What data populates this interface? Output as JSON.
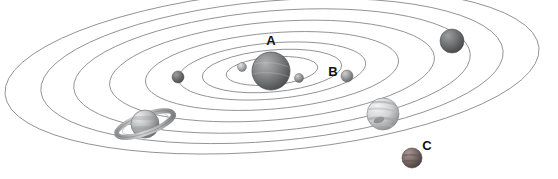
{
  "diagram": {
    "background_color": "#ffffff",
    "orbit_line_color": "#808080",
    "label_color": "#111111",
    "labels": [
      {
        "id": "A",
        "text": "A",
        "x": 271,
        "y": 45,
        "refers_to": "central star (sun)"
      },
      {
        "id": "B",
        "text": "B",
        "x": 333,
        "y": 76,
        "refers_to": "inner planet on orbit 3"
      },
      {
        "id": "C",
        "text": "C",
        "x": 427,
        "y": 150,
        "refers_to": "outer small planet on orbit 7"
      }
    ],
    "orbits": [
      {
        "index": 1,
        "rx": 46,
        "ry": 14,
        "note": "innermost orbit"
      },
      {
        "index": 2,
        "rx": 70,
        "ry": 21,
        "note": "second orbit"
      },
      {
        "index": 3,
        "rx": 94,
        "ry": 28,
        "note": "third orbit, planet B"
      },
      {
        "index": 4,
        "rx": 127,
        "ry": 38,
        "note": "fourth orbit"
      },
      {
        "index": 5,
        "rx": 163,
        "ry": 49,
        "note": "fifth orbit, ringed planet"
      },
      {
        "index": 6,
        "rx": 199,
        "ry": 60,
        "note": "sixth orbit, striped gas giant"
      },
      {
        "index": 7,
        "rx": 232,
        "ry": 70,
        "note": "seventh orbit, planet C"
      },
      {
        "index": 8,
        "rx": 268,
        "ry": 80,
        "note": "outermost orbit"
      }
    ],
    "orbit_center": {
      "cx": 272,
      "cy": 71
    },
    "orbit_tilt_degrees": -5,
    "bodies": [
      {
        "name": "sun",
        "label": "A",
        "type": "star",
        "cx": 271,
        "cy": 71,
        "r": 19,
        "color": "#77787a",
        "highlight": "#a9aaad",
        "shadow": "#4a4b4d"
      },
      {
        "name": "inner-planet-left",
        "type": "planet",
        "cx": 242,
        "cy": 67,
        "r": 4.5,
        "color": "#a9aaac",
        "highlight": "#d6d7d8",
        "shadow": "#77787a"
      },
      {
        "name": "inner-planet-right",
        "type": "planet",
        "cx": 299,
        "cy": 78,
        "r": 4.5,
        "color": "#9a9b9d",
        "highlight": "#cccdcf",
        "shadow": "#6d6e70"
      },
      {
        "name": "planet-b",
        "label": "B",
        "type": "planet",
        "cx": 347,
        "cy": 76,
        "r": 6,
        "color": "#939496",
        "highlight": "#c8c9cb",
        "shadow": "#636466"
      },
      {
        "name": "dark-planet-left",
        "type": "planet",
        "cx": 178,
        "cy": 77,
        "r": 6,
        "color": "#6e6f71",
        "highlight": "#9c9d9f",
        "shadow": "#474849"
      },
      {
        "name": "ringed-planet",
        "type": "ringed-planet",
        "cx": 145,
        "cy": 124,
        "r": 14,
        "ring_rx": 30,
        "ring_ry": 9,
        "ring_rotate": -20,
        "color": "#a8a9ab",
        "highlight": "#e0e1e2",
        "shadow": "#6f7072"
      },
      {
        "name": "striped-gas-giant",
        "type": "planet",
        "cx": 383,
        "cy": 114,
        "r": 16,
        "color": "#cfd0d1",
        "highlight": "#f2f2f3",
        "shadow": "#8a8b8d"
      },
      {
        "name": "planet-c",
        "label": "C",
        "type": "planet",
        "cx": 412,
        "cy": 158,
        "r": 10,
        "color": "#7a6a68",
        "highlight": "#a99a97",
        "shadow": "#4e4240"
      },
      {
        "name": "outer-gray-planet",
        "type": "planet",
        "cx": 452,
        "cy": 41,
        "r": 12,
        "color": "#78797b",
        "highlight": "#a4a5a7",
        "shadow": "#4e4f51"
      }
    ]
  }
}
